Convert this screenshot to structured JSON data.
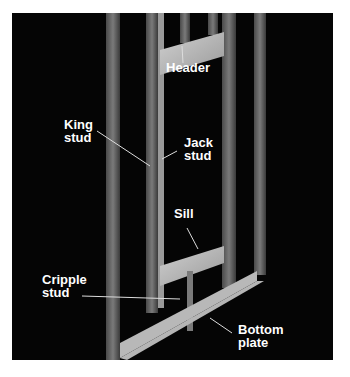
{
  "figure": {
    "background": "#050505",
    "wood_color": "#8a8a8a",
    "light_wood_color": "#c8c8c8",
    "labels": {
      "header": "Header",
      "king_stud_1": "King",
      "king_stud_2": "stud",
      "jack_stud_1": "Jack",
      "jack_stud_2": "stud",
      "sill": "Sill",
      "cripple_stud_1": "Cripple",
      "cripple_stud_2": "stud",
      "bottom_plate_1": "Bottom",
      "bottom_plate_2": "plate"
    }
  }
}
